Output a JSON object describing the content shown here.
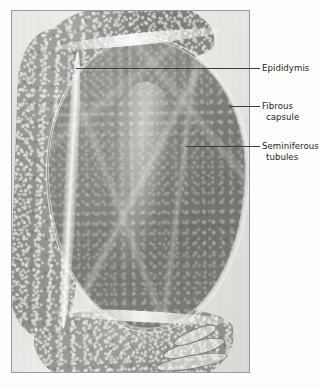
{
  "figure": {
    "kind": "histology-micrograph",
    "page_background": "#fdfdfd"
  },
  "plate": {
    "name": "light-micrograph-plate",
    "border_color": "#9a9a98",
    "film_base_color": "#dcdbd7"
  },
  "specimen": {
    "regions": [
      {
        "id": "epididymis-top-lobe",
        "tissue": "epididymis",
        "tone": "#7e7d79",
        "texture": "granular tubule cross-sections"
      },
      {
        "id": "epididymis-left-strip",
        "tissue": "epididymis",
        "tone": "#8c8b87",
        "texture": "granular tubule cross-sections"
      },
      {
        "id": "epididymis-bottom-lobe",
        "tissue": "epididymis",
        "tone": "#8a8985",
        "texture": "round vacuolated tubules"
      },
      {
        "id": "testis-body",
        "tissue": "seminiferous tubules",
        "tone": "#82817d",
        "texture": "fine fibrous septa radiating from mediastinum"
      },
      {
        "id": "mediastinum-testis",
        "tissue": "mediastinum",
        "tone": "#f8f8f6",
        "texture": "pale radiating wedge"
      }
    ],
    "ducts": {
      "id": "ductus-deferens-coils",
      "outline_color": "#7d7c78",
      "count": 3
    },
    "capsule": {
      "id": "tunica-albuginea",
      "highlight_color": "#fafaf8"
    }
  },
  "annotations": {
    "leader_color": "#3b3b3b",
    "text_color": "#231f20",
    "labels": [
      {
        "id": "epididymis",
        "line1": "Epididymis",
        "line2": "",
        "leader_from_x": 76,
        "leader_y": 68
      },
      {
        "id": "fibrous-capsule",
        "line1": "Fibrous",
        "line2": "capsule",
        "leader_from_x": 229,
        "leader_y": 106
      },
      {
        "id": "seminiferous-tubules",
        "line1": "Seminiferous",
        "line2": "tubules",
        "leader_from_x": 186,
        "leader_y": 146
      }
    ]
  }
}
